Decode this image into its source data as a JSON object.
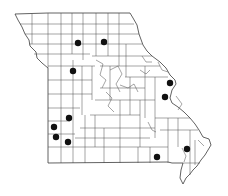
{
  "map": {
    "region": "Missouri",
    "subdivision": "counties",
    "background_color": "#ffffff",
    "line_color": "#3a3a3a",
    "dot_color": "#111111",
    "dot_radius": 3.2,
    "occurrence_dots": [
      {
        "id": "dot-1",
        "x": 78,
        "y": 43
      },
      {
        "id": "dot-2",
        "x": 104,
        "y": 42
      },
      {
        "id": "dot-3",
        "x": 73,
        "y": 71
      },
      {
        "id": "dot-4",
        "x": 170,
        "y": 83
      },
      {
        "id": "dot-5",
        "x": 165,
        "y": 97
      },
      {
        "id": "dot-6",
        "x": 69,
        "y": 118
      },
      {
        "id": "dot-7",
        "x": 54,
        "y": 127
      },
      {
        "id": "dot-8",
        "x": 56,
        "y": 137
      },
      {
        "id": "dot-9",
        "x": 68,
        "y": 142
      },
      {
        "id": "dot-10",
        "x": 187,
        "y": 149
      },
      {
        "id": "dot-11",
        "x": 157,
        "y": 157
      }
    ]
  }
}
